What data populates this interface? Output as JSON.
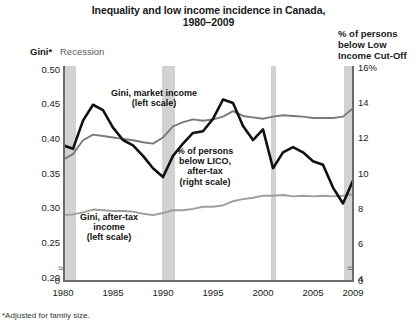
{
  "header": {
    "title_line1": "Inequality and low income incidence in Canada,",
    "title_line2": "1980–2009",
    "left_axis_label": "Gini*",
    "right_axis_label_l1": "% of persons",
    "right_axis_label_l2": "below Low",
    "right_axis_label_l3": "Income Cut-Off",
    "recession_label": "Recession",
    "footnote": "*Adjusted for family size."
  },
  "annotations": {
    "market": "Gini, market income\n(left scale)",
    "market_l1": "Gini, market income",
    "market_l2": "(left scale)",
    "lico_l1": "% of persons",
    "lico_l2": "below LICO,",
    "lico_l3": "after-tax",
    "lico_l4": "(right scale)",
    "aftertax_l1": "Gini, after-tax",
    "aftertax_l2": "income",
    "aftertax_l3": "(left scale)"
  },
  "colors": {
    "gini_market": "#7a7a7a",
    "gini_aftertax": "#9d9d9d",
    "lico": "#111111",
    "recession_band": "#d2d2d2",
    "axis": "#6b6b6b",
    "background": "#ffffff"
  },
  "chart_data": {
    "type": "line",
    "title": "Inequality and low income incidence in Canada, 1980–2009",
    "xlabel": "",
    "ylabel": "Gini*",
    "y2label": "% of persons below Low Income Cut-Off",
    "grid": false,
    "legend": "inline-annotations",
    "axis_break": true,
    "x": [
      1980,
      1981,
      1982,
      1983,
      1984,
      1985,
      1986,
      1987,
      1988,
      1989,
      1990,
      1991,
      1992,
      1993,
      1994,
      1995,
      1996,
      1997,
      1998,
      1999,
      2000,
      2001,
      2002,
      2003,
      2004,
      2005,
      2006,
      2007,
      2008,
      2009
    ],
    "xticks": [
      1980,
      1985,
      1990,
      1995,
      2000,
      2005,
      2009
    ],
    "yticks_left": [
      "0.50",
      "0.45",
      "0.40",
      "0.35",
      "0.30",
      "0.25",
      "0.20",
      "0"
    ],
    "yticks_right": [
      "16%",
      "14",
      "12",
      "10",
      "8",
      "6",
      "4",
      "0"
    ],
    "ylim_left": [
      0.195,
      0.505
    ],
    "ylim_right": [
      3.9,
      16.1
    ],
    "recessions": [
      {
        "start": 1980.0,
        "end": 1981.3
      },
      {
        "start": 1989.9,
        "end": 1991.2
      },
      {
        "start": 2000.8,
        "end": 2001.3
      },
      {
        "start": 2008.1,
        "end": 2009.0
      }
    ],
    "series": [
      {
        "name": "Gini, market income (left scale)",
        "axis": "left",
        "color": "#7a7a7a",
        "values": [
          0.37,
          0.378,
          0.398,
          0.406,
          0.404,
          0.402,
          0.4,
          0.398,
          0.395,
          0.393,
          0.402,
          0.418,
          0.424,
          0.428,
          0.426,
          0.428,
          0.432,
          0.44,
          0.433,
          0.431,
          0.429,
          0.432,
          0.434,
          0.433,
          0.432,
          0.43,
          0.43,
          0.43,
          0.432,
          0.444
        ]
      },
      {
        "name": "Gini, after-tax income (left scale)",
        "axis": "left",
        "color": "#9d9d9d",
        "values": [
          0.29,
          0.291,
          0.294,
          0.298,
          0.297,
          0.296,
          0.296,
          0.295,
          0.292,
          0.29,
          0.293,
          0.297,
          0.297,
          0.299,
          0.302,
          0.302,
          0.304,
          0.31,
          0.313,
          0.315,
          0.318,
          0.318,
          0.319,
          0.317,
          0.318,
          0.317,
          0.318,
          0.317,
          0.318,
          0.32
        ]
      },
      {
        "name": "% of persons below LICO, after-tax (right scale)",
        "axis": "right",
        "color": "#111111",
        "values": [
          11.6,
          11.4,
          13.0,
          13.9,
          13.6,
          12.6,
          11.9,
          11.6,
          11.0,
          10.3,
          9.8,
          11.0,
          11.7,
          12.3,
          12.4,
          13.1,
          14.2,
          14.0,
          12.7,
          11.9,
          12.5,
          10.3,
          11.2,
          11.5,
          11.2,
          10.7,
          10.5,
          9.2,
          8.3,
          9.6
        ]
      }
    ]
  }
}
